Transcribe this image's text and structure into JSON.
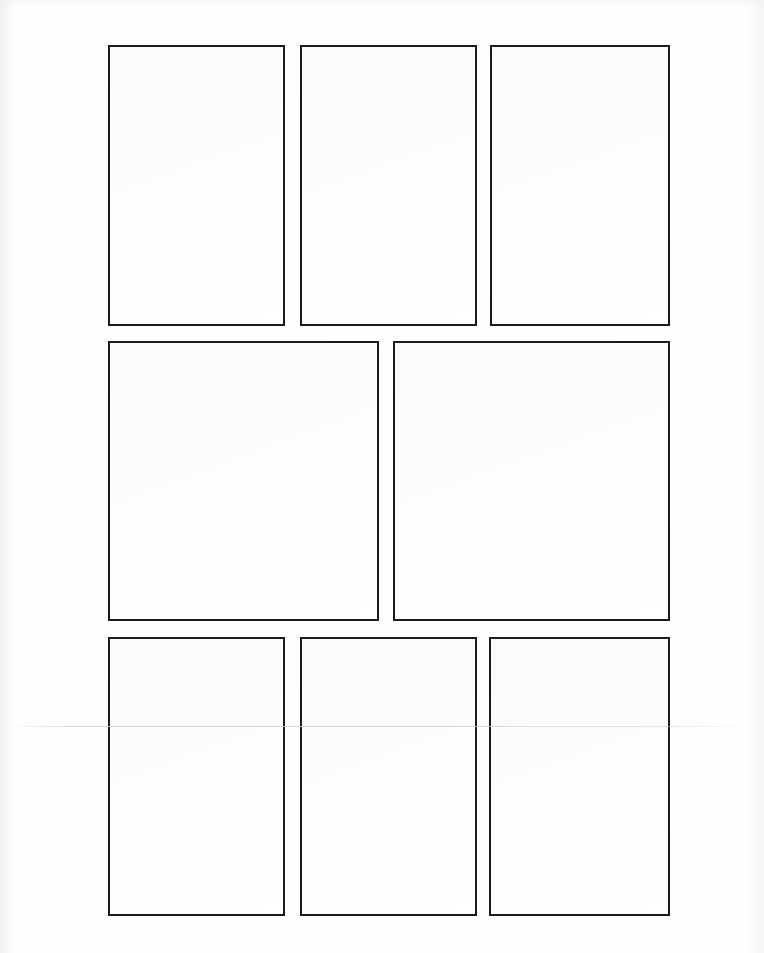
{
  "document": {
    "kind": "blank-comic-page-template",
    "title": "Blank Comic Book Page Template",
    "page_width": 764,
    "page_height": 953,
    "background_color": "#fefefe",
    "panel_fill_color": "#ffffff",
    "panel_border_color": "#1b1b1d",
    "panel_border_width": 2,
    "panel_count": 8,
    "row_count": 3,
    "has_text": false,
    "has_artwork": false,
    "artifacts": [
      {
        "name": "scan-fold-line",
        "orientation": "horizontal",
        "y": 726,
        "color": "#d1d1d6"
      }
    ]
  },
  "rows": [
    {
      "name": "row-1",
      "label": "Top row",
      "panel_count": 3,
      "top": 45,
      "height": 281,
      "panels": [
        {
          "name": "panel-1",
          "label": "Panel 1",
          "x": 108,
          "y": 45,
          "width": 177,
          "height": 281,
          "orientation": "portrait"
        },
        {
          "name": "panel-2",
          "label": "Panel 2",
          "x": 300,
          "y": 45,
          "width": 177,
          "height": 281,
          "orientation": "portrait"
        },
        {
          "name": "panel-3",
          "label": "Panel 3",
          "x": 490,
          "y": 45,
          "width": 180,
          "height": 281,
          "orientation": "portrait"
        }
      ]
    },
    {
      "name": "row-2",
      "label": "Middle row",
      "panel_count": 2,
      "top": 341,
      "height": 280,
      "panels": [
        {
          "name": "panel-4",
          "label": "Panel 4",
          "x": 108,
          "y": 341,
          "width": 271,
          "height": 280,
          "orientation": "landscape"
        },
        {
          "name": "panel-5",
          "label": "Panel 5",
          "x": 393,
          "y": 341,
          "width": 277,
          "height": 280,
          "orientation": "landscape"
        }
      ]
    },
    {
      "name": "row-3",
      "label": "Bottom row",
      "panel_count": 3,
      "top": 637,
      "height": 279,
      "panels": [
        {
          "name": "panel-6",
          "label": "Panel 6",
          "x": 108,
          "y": 637,
          "width": 177,
          "height": 279,
          "orientation": "portrait"
        },
        {
          "name": "panel-7",
          "label": "Panel 7",
          "x": 300,
          "y": 637,
          "width": 177,
          "height": 279,
          "orientation": "portrait"
        },
        {
          "name": "panel-8",
          "label": "Panel 8",
          "x": 489,
          "y": 637,
          "width": 181,
          "height": 279,
          "orientation": "portrait"
        }
      ]
    }
  ],
  "margins": {
    "left": 108,
    "right": 94,
    "top": 45,
    "bottom": 37
  },
  "gutters": {
    "vertical": 15,
    "horizontal": 16
  }
}
